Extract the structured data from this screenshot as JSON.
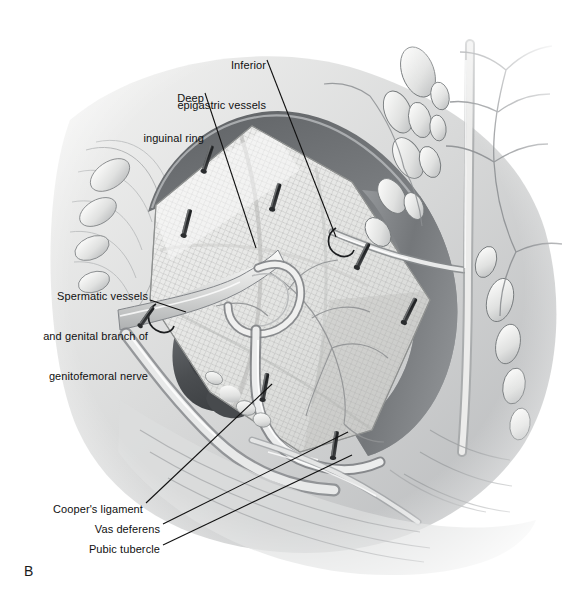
{
  "figure": {
    "panel_letter": "B",
    "domain_kind": "medical-illustration",
    "background_color": "#ffffff",
    "ink_color": "#101010",
    "width": 571,
    "height": 598
  },
  "labels": {
    "inferior_epigastric": {
      "line1": "Inferior",
      "line2": "epigastric vessels",
      "align": "right"
    },
    "deep_inguinal_ring": {
      "line1": "Deep",
      "line2": "inguinal ring",
      "align": "right"
    },
    "spermatic": {
      "line1": "Spermatic vessels",
      "line2": "and genital branch of",
      "line3": "genitofemoral nerve",
      "align": "right"
    },
    "coopers_ligament": {
      "text": "Cooper's ligament",
      "align": "right"
    },
    "vas_deferens": {
      "text": "Vas deferens",
      "align": "right"
    },
    "pubic_tubercle": {
      "text": "Pubic tubercle",
      "align": "right"
    }
  },
  "leaders": [
    {
      "name": "leader-inferior-epigastric",
      "x1": 267,
      "y1": 60,
      "x2": 336,
      "y2": 237
    },
    {
      "name": "leader-deep-inguinal-ring",
      "x1": 205,
      "y1": 93,
      "x2": 256,
      "y2": 248
    },
    {
      "name": "leader-spermatic",
      "x1": 150,
      "y1": 300,
      "x2": 186,
      "y2": 312
    },
    {
      "name": "leader-coopers-ligament",
      "x1": 146,
      "y1": 503,
      "x2": 272,
      "y2": 384
    },
    {
      "name": "leader-vas-deferens",
      "x1": 163,
      "y1": 524,
      "x2": 348,
      "y2": 432
    },
    {
      "name": "leader-pubic-tubercle",
      "x1": 163,
      "y1": 545,
      "x2": 352,
      "y2": 455
    }
  ],
  "staples": [
    {
      "name": "staple-1",
      "x": 208,
      "y": 158,
      "angle": 18
    },
    {
      "name": "staple-2",
      "x": 276,
      "y": 196,
      "angle": 16
    },
    {
      "name": "staple-3",
      "x": 187,
      "y": 222,
      "angle": 14
    },
    {
      "name": "staple-4",
      "x": 363,
      "y": 255,
      "angle": 26
    },
    {
      "name": "staple-5",
      "x": 410,
      "y": 310,
      "angle": 26
    },
    {
      "name": "staple-6",
      "x": 265,
      "y": 386,
      "angle": 10
    },
    {
      "name": "staple-7",
      "x": 335,
      "y": 444,
      "angle": 8
    },
    {
      "name": "staple-8",
      "x": 147,
      "y": 316,
      "angle": 35
    }
  ],
  "tones": {
    "peritoneal_flap_dark": "#6f7275",
    "peritoneal_flap_mid": "#8d9094",
    "mesh_light": "#e6e6e4",
    "mesh_shadow": "#c3c4c3",
    "tissue_light": "#efefee",
    "tissue_mid": "#cfd0d0",
    "tissue_shadow": "#a3a5a7",
    "cavity_dark": "#4a4d50",
    "outline": "#5a5d60"
  }
}
